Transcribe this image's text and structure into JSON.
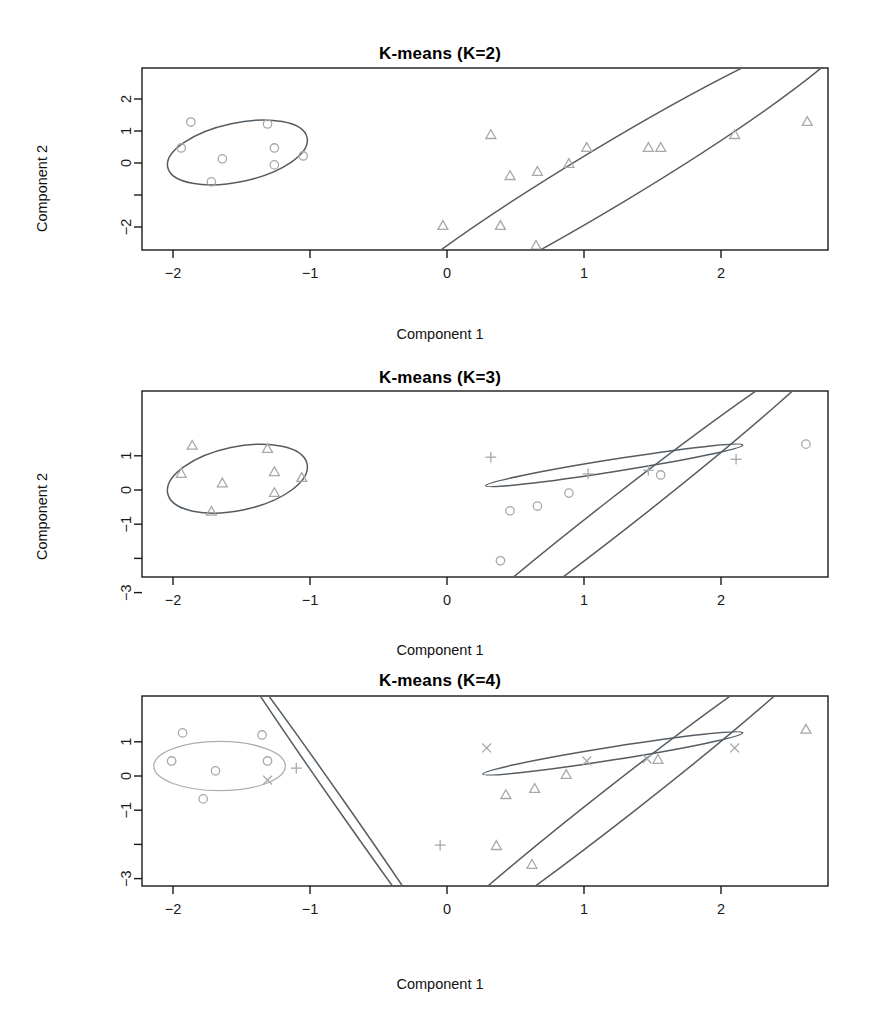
{
  "figure": {
    "axis_label_x": "Component 1",
    "axis_label_y": "Component 2"
  },
  "panels": [
    {
      "title": "K-means (K=2)",
      "xlabel": "Component 1",
      "ylabel": "Component 2"
    },
    {
      "title": "K-means (K=3)",
      "xlabel": "Component 1",
      "ylabel": "Component 2"
    },
    {
      "title": "K-means (K=4)",
      "xlabel": "Component 1",
      "ylabel": "Component 2"
    }
  ],
  "chart_data": [
    {
      "type": "scatter",
      "title": "K-means (K=2)",
      "xlabel": "Component 1",
      "ylabel": "Component 2",
      "xlim": [
        -2.35,
        3.0
      ],
      "ylim": [
        -2.95,
        2.35
      ],
      "xticks": [
        -2,
        -1,
        0,
        1,
        2
      ],
      "yticks": [
        2,
        1,
        0,
        -1,
        -2
      ],
      "ytick_labels": [
        "2",
        "1",
        "0",
        "",
        "-2"
      ],
      "grid": false,
      "legend": "none",
      "series": [
        {
          "name": "cluster 1",
          "marker": "circle",
          "color": "#a8a8a8",
          "points": [
            [
              -1.87,
              1.28
            ],
            [
              -1.31,
              1.22
            ],
            [
              -1.94,
              0.47
            ],
            [
              -1.26,
              0.47
            ],
            [
              -1.64,
              0.13
            ],
            [
              -1.26,
              -0.06
            ],
            [
              -1.05,
              0.22
            ],
            [
              -1.72,
              -0.59
            ]
          ],
          "ellipse": {
            "cx": -1.53,
            "cy": 0.33,
            "rx": 0.52,
            "ry": 0.92,
            "angle": -12
          }
        },
        {
          "name": "cluster 2",
          "marker": "triangle",
          "color": "#a8a8a8",
          "points": [
            [
              0.32,
              0.87
            ],
            [
              0.46,
              -0.41
            ],
            [
              0.66,
              -0.28
            ],
            [
              0.89,
              -0.03
            ],
            [
              1.02,
              0.47
            ],
            [
              1.47,
              0.47
            ],
            [
              1.56,
              0.47
            ],
            [
              2.1,
              0.87
            ],
            [
              2.63,
              1.28
            ],
            [
              -0.03,
              -1.97
            ],
            [
              0.39,
              -1.97
            ],
            [
              0.65,
              -2.59
            ]
          ],
          "ellipse": {
            "cx": 1.18,
            "cy": -0.41,
            "rx": 2.1,
            "ry": 0.93,
            "angle": -31
          }
        }
      ]
    },
    {
      "type": "scatter",
      "title": "K-means (K=3)",
      "xlabel": "Component 1",
      "ylabel": "Component 2",
      "xlim": [
        -2.35,
        3.0
      ],
      "ylim": [
        -3.3,
        1.75
      ],
      "xticks": [
        -2,
        -1,
        0,
        1,
        2
      ],
      "yticks": [
        1,
        0,
        -1,
        -2,
        -3
      ],
      "ytick_labels": [
        "1",
        "0",
        "-1",
        "",
        "-3"
      ],
      "grid": false,
      "legend": "none",
      "series": [
        {
          "name": "cluster 1",
          "marker": "triangle",
          "color": "#a8a8a8",
          "points": [
            [
              -1.86,
              1.29
            ],
            [
              -1.31,
              1.2
            ],
            [
              -1.94,
              0.47
            ],
            [
              -1.26,
              0.52
            ],
            [
              -1.64,
              0.19
            ],
            [
              -1.26,
              -0.09
            ],
            [
              -1.06,
              0.35
            ],
            [
              -1.72,
              -0.64
            ]
          ],
          "ellipse": {
            "cx": -1.53,
            "cy": 0.33,
            "rx": 0.52,
            "ry": 0.93,
            "angle": -12
          }
        },
        {
          "name": "cluster 2",
          "marker": "plus",
          "color": "#a8a8a8",
          "points": [
            [
              0.32,
              0.96
            ],
            [
              1.03,
              0.47
            ],
            [
              1.47,
              0.58
            ],
            [
              2.11,
              0.9
            ]
          ],
          "ellipse": {
            "cx": 1.22,
            "cy": 0.72,
            "rx": 0.95,
            "ry": 0.18,
            "angle": -9
          }
        },
        {
          "name": "cluster 3",
          "marker": "circle",
          "color": "#a8a8a8",
          "points": [
            [
              2.62,
              1.34
            ],
            [
              1.56,
              0.44
            ],
            [
              0.89,
              -0.09
            ],
            [
              0.66,
              -0.47
            ],
            [
              0.46,
              -0.61
            ],
            [
              0.39,
              -2.07
            ],
            [
              0.66,
              -2.69
            ]
          ],
          "ellipse": {
            "cx": 1.25,
            "cy": -0.7,
            "rx": 2.0,
            "ry": 0.48,
            "angle": -38
          }
        }
      ]
    },
    {
      "type": "scatter",
      "title": "K-means (K=4)",
      "xlabel": "Component 1",
      "ylabel": "Component 2",
      "xlim": [
        -2.35,
        3.0
      ],
      "ylim": [
        -3.3,
        1.75
      ],
      "xticks": [
        -2,
        -1,
        0,
        1,
        2
      ],
      "yticks": [
        1,
        0,
        -1,
        -2,
        -3
      ],
      "ytick_labels": [
        "1",
        "0",
        "-1",
        "",
        "-3"
      ],
      "grid": false,
      "legend": "none",
      "series": [
        {
          "name": "cluster 1",
          "marker": "circle",
          "color": "#a8a8a8",
          "points": [
            [
              -1.93,
              1.26
            ],
            [
              -1.35,
              1.2
            ],
            [
              -2.01,
              0.44
            ],
            [
              -1.69,
              0.15
            ],
            [
              -1.31,
              0.44
            ],
            [
              -1.78,
              -0.67
            ]
          ],
          "ellipse": {
            "cx": -1.66,
            "cy": 0.29,
            "rx": 0.48,
            "ry": 0.72,
            "angle": 0
          },
          "ellipse_style": "light"
        },
        {
          "name": "cluster 2",
          "marker": "plus",
          "color": "#a8a8a8",
          "points": [
            [
              -1.1,
              0.23
            ],
            [
              -0.05,
              -2.02
            ]
          ],
          "ellipse": {
            "cx": -0.78,
            "cy": -0.82,
            "rx": 1.42,
            "ry": 0.14,
            "angle": 55
          }
        },
        {
          "name": "cluster 3",
          "marker": "cross",
          "color": "#a8a8a8",
          "points": [
            [
              -1.31,
              -0.12
            ],
            [
              0.29,
              0.82
            ],
            [
              1.02,
              0.44
            ],
            [
              1.46,
              0.5
            ],
            [
              2.1,
              0.82
            ]
          ],
          "ellipse": {
            "cx": 1.21,
            "cy": 0.66,
            "rx": 0.96,
            "ry": 0.19,
            "angle": -9
          }
        },
        {
          "name": "cluster 4",
          "marker": "triangle",
          "color": "#a8a8a8",
          "points": [
            [
              2.62,
              1.35
            ],
            [
              1.54,
              0.47
            ],
            [
              0.87,
              0.03
            ],
            [
              0.64,
              -0.38
            ],
            [
              0.43,
              -0.56
            ],
            [
              0.36,
              -2.05
            ],
            [
              0.62,
              -2.6
            ]
          ],
          "ellipse": {
            "cx": 1.28,
            "cy": -0.66,
            "rx": 2.0,
            "ry": 0.5,
            "angle": -38
          }
        }
      ]
    }
  ]
}
